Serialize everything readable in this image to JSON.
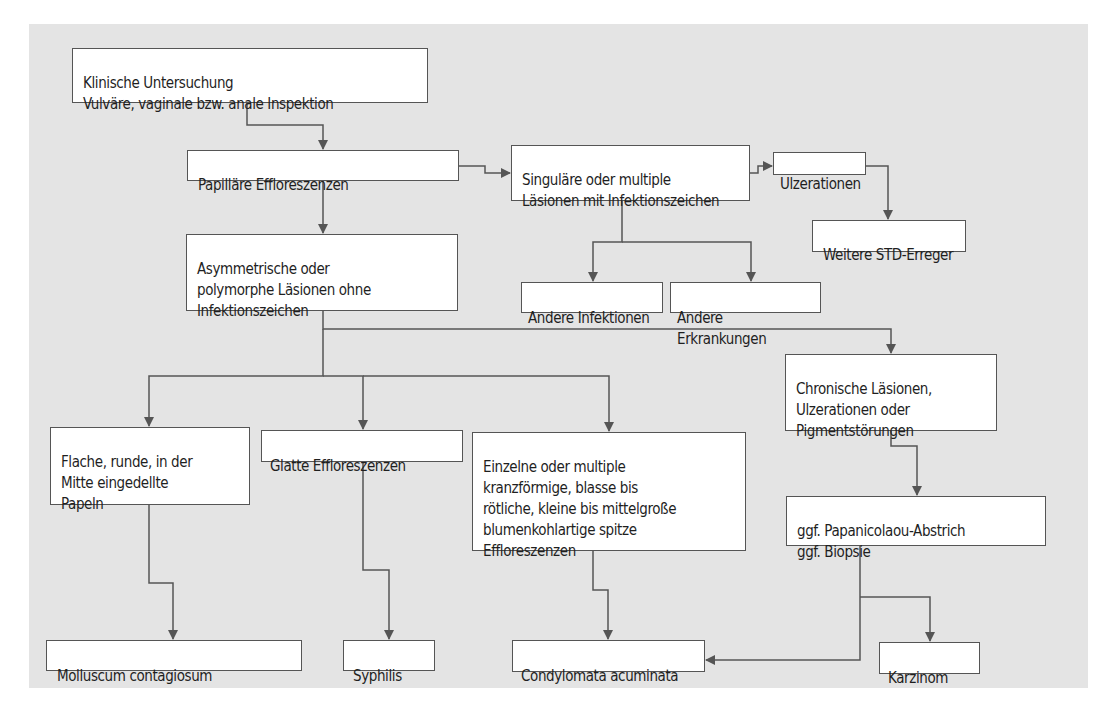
{
  "colors": {
    "background_panel": "#e4e4e4",
    "box_fill": "#ffffff",
    "box_border": "#555555",
    "line": "#555555",
    "text": "#1f1f1f"
  },
  "nodes": {
    "start": {
      "label": "Klinische Untersuchung\nVulväre, vaginale bzw. anale Inspektion"
    },
    "papillary": {
      "label": "Papilläre Effloreszenzen"
    },
    "infection_signs": {
      "label": "Singuläre oder multiple\nLäsionen mit Infektionszeichen"
    },
    "ulcerations": {
      "label": "Ulzerationen"
    },
    "other_std": {
      "label": "Weitere STD-Erreger"
    },
    "asymmetric": {
      "label": "Asymmetrische oder\npolymorphe Läsionen ohne\nInfektionszeichen"
    },
    "other_infections": {
      "label": "Andere Infektionen"
    },
    "other_diseases": {
      "label": "Andere Erkrankungen"
    },
    "flat_round": {
      "label": "Flache, runde, in der\nMitte eingedellte\nPapeln"
    },
    "smooth": {
      "label": "Glatte Effloreszenzen"
    },
    "single_multiple": {
      "label": "Einzelne oder multiple\nkranzförmige, blasse bis\nrötliche, kleine bis mittelgroße\nblumenkohlartige spitze\nEffloreszenzen"
    },
    "chronic": {
      "label": "Chronische Läsionen,\nUlzerationen oder\nPigmentstörungen"
    },
    "pap_biopsy": {
      "label": "ggf. Papanicolaou-Abstrich\nggf. Biopsie"
    },
    "molluscum": {
      "label": "Molluscum contagiosum"
    },
    "syphilis": {
      "label": "Syphilis"
    },
    "condylomata": {
      "label": "Condylomata acuminata"
    },
    "carcinoma": {
      "label": "Karzinom"
    }
  },
  "edges": [
    [
      "start",
      "papillary"
    ],
    [
      "papillary",
      "infection_signs"
    ],
    [
      "infection_signs",
      "ulcerations"
    ],
    [
      "ulcerations",
      "other_std"
    ],
    [
      "infection_signs",
      "other_infections"
    ],
    [
      "infection_signs",
      "other_diseases"
    ],
    [
      "papillary",
      "asymmetric"
    ],
    [
      "asymmetric",
      "flat_round"
    ],
    [
      "asymmetric",
      "smooth"
    ],
    [
      "asymmetric",
      "single_multiple"
    ],
    [
      "asymmetric",
      "chronic"
    ],
    [
      "chronic",
      "pap_biopsy"
    ],
    [
      "flat_round",
      "molluscum"
    ],
    [
      "smooth",
      "syphilis"
    ],
    [
      "single_multiple",
      "condylomata"
    ],
    [
      "pap_biopsy",
      "condylomata"
    ],
    [
      "pap_biopsy",
      "carcinoma"
    ]
  ]
}
